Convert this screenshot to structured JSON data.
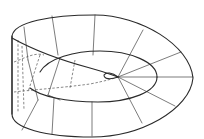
{
  "figure": {
    "stroke_color": "#2a2a2a",
    "background": "#ffffff",
    "caption": ""
  },
  "geometry": {
    "outer_boundary": "M12,36 C14,22 50,15 95,15 C140,15 190,45 193,78 C190,110 140,137 92,137 C45,137 12,128 12,114 Z",
    "left_edge": "M12,36 L12,114",
    "twisted_band_edge": "M12,38 C30,48 60,60 90,68 C105,72 112,75 118,77",
    "middle_ellipse_upper": "M40,72 C48,58 75,51 100,51 C130,51 157,62 157,77",
    "middle_ellipse_lower": "M157,77 C157,92 130,102 98,102 C65,102 40,96 30,88",
    "inner_loop": "M118,77 C112,72 106,72 104,75 C104,79 110,80 118,77",
    "hidden_lower": "M14,92 C30,90 60,88 90,84 C105,81 112,79 118,77",
    "hidden_left_band": "M14,62 C25,58 35,52 44,55",
    "radial_lines": [
      "M118,77 L193,77",
      "M118,77 L181,52",
      "M118,77 L175,106",
      "M118,77 L143,30",
      "M118,77 L142,123",
      "M95,15 L93,55",
      "M52,16 L58,55",
      "M92,102 L92,136",
      "M54,98 L52,134",
      "M24,27 L28,60",
      "M28,60 L38,100",
      "M38,100 L22,130",
      "M60,58 L48,95",
      "M48,95 L60,100"
    ],
    "hidden_lines": [
      "M18,40 L18,112",
      "M22,46 L24,110",
      "M40,55 L28,92",
      "M75,60 L70,88"
    ]
  }
}
